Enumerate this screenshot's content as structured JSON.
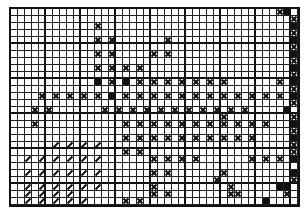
{
  "chart": {
    "type": "knitting-chart",
    "columns": 41,
    "rows": 28,
    "cell_width": 7,
    "cell_height": 7,
    "major_line_every": 5,
    "legend_symbols": {
      ".": "empty",
      "x": "cross-stitch",
      "f": "filled",
      "s": "slash"
    },
    "colors": {
      "ink": "#111111",
      "paper": "#ffffff"
    },
    "grid": [
      "......................................xf",
      "........................................x",
      "............x...........................f",
      "........................................x",
      "............x.x.......x.................f",
      "........................................x",
      "............x.x.....x.x.................f",
      "........................................x",
      "............x.x.x.x.....................f",
      "........................................x",
      "............f.x.f.x.x.x.x.x.x.x.......x.f",
      "........................................x",
      "....x.x.x.x.x.f.x.x.x.x.x.x.x.x.x.x.x.x.f",
      "........................................x",
      "...x.x.......x.x.x.x.x.x.x.x.x.x.x.....f",
      "..............................x.........x",
      "...x............x.x.x.x.x.x.x.x.x.x.x...f",
      "........................................x",
      "................x.x.x.x.x.x.x.x.x.x.....f",
      "......s.s.s.s...........................x",
      "................x.x.....................x",
      "..s.s.s.s.s.s.......x.x.x.x.......x.x.x.f",
      "..........................................",
      "..s.s.s.s.s.s.......x.x.......x.........f",
      ".............................x..........x",
      "..s.s.s.s.s.s.......x..........x......ff",
      "..s.s.s.s...........x.x........xx......x",
      "..s.s.s.s.s.....x.x.................f..."
    ]
  }
}
